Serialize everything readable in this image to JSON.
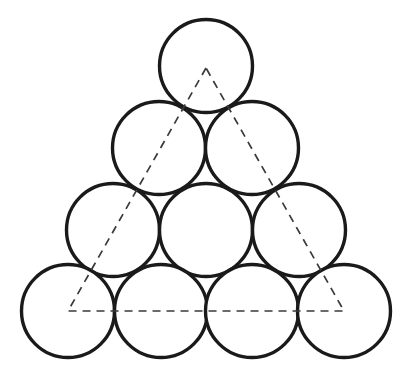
{
  "figure": {
    "background_color": "#ffffff",
    "canvas": {
      "width": 407,
      "height": 386
    }
  },
  "style": {
    "circle_stroke_color": "#1a1a1a",
    "circle_fill_color": "#ffffff",
    "circle_stroke_width": 3.4,
    "dash_stroke_color": "#3a3a3a",
    "dash_stroke_width": 1.7,
    "dash_pattern": "8 6"
  },
  "geometry": {
    "circle_radius": 46.5,
    "row_vertical_spacing": 80.5,
    "row_count": 4,
    "circle_count": 10
  },
  "circles": [
    {
      "id": "circle-r1-c1",
      "row": 1,
      "index": 1,
      "cx": 206,
      "cy": 66,
      "r": 46.5
    },
    {
      "id": "circle-r2-c1",
      "row": 2,
      "index": 1,
      "cx": 159,
      "cy": 148,
      "r": 46.5
    },
    {
      "id": "circle-r2-c2",
      "row": 2,
      "index": 2,
      "cx": 252,
      "cy": 148,
      "r": 46.5
    },
    {
      "id": "circle-r3-c1",
      "row": 3,
      "index": 1,
      "cx": 113,
      "cy": 230,
      "r": 46.5
    },
    {
      "id": "circle-r3-c2",
      "row": 3,
      "index": 2,
      "cx": 206,
      "cy": 230,
      "r": 46.5
    },
    {
      "id": "circle-r3-c3",
      "row": 3,
      "index": 3,
      "cx": 299,
      "cy": 230,
      "r": 46.5
    },
    {
      "id": "circle-r4-c1",
      "row": 4,
      "index": 1,
      "cx": 68,
      "cy": 311,
      "r": 46.5
    },
    {
      "id": "circle-r4-c2",
      "row": 4,
      "index": 2,
      "cx": 161,
      "cy": 311,
      "r": 46.5
    },
    {
      "id": "circle-r4-c3",
      "row": 4,
      "index": 3,
      "cx": 252,
      "cy": 311,
      "r": 46.5
    },
    {
      "id": "circle-r4-c4",
      "row": 4,
      "index": 4,
      "cx": 344,
      "cy": 311,
      "r": 46.5
    }
  ],
  "dashed_triangle": {
    "label": "triangle through corner circle centres",
    "vertices": [
      {
        "name": "apex",
        "x": 206,
        "y": 68
      },
      {
        "name": "bottom-left",
        "x": 68,
        "y": 311
      },
      {
        "name": "bottom-right",
        "x": 344,
        "y": 311
      }
    ],
    "points_attr": "206,68 68,311 344,311",
    "edges": [
      {
        "name": "left-edge",
        "from": "apex",
        "to": "bottom-left"
      },
      {
        "name": "bottom-edge",
        "from": "bottom-left",
        "to": "bottom-right"
      },
      {
        "name": "right-edge",
        "from": "bottom-right",
        "to": "apex"
      }
    ]
  }
}
